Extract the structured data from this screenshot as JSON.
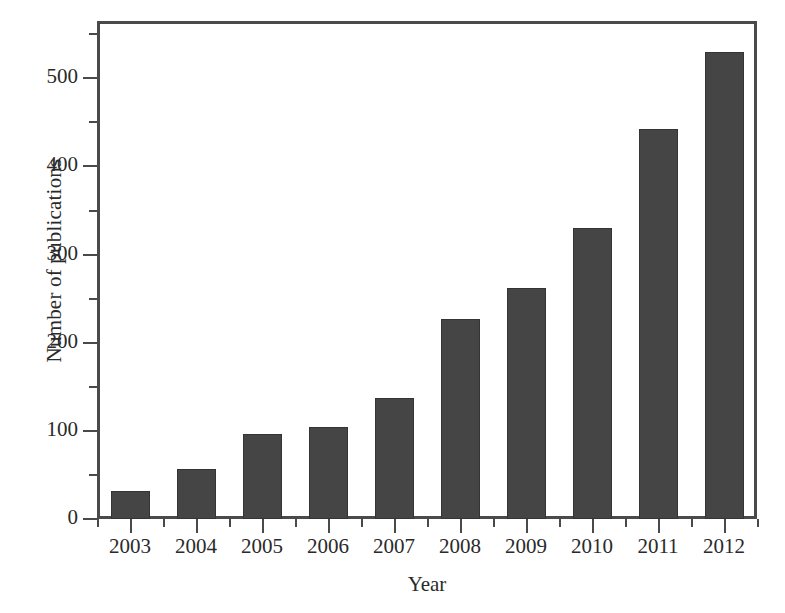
{
  "chart_data": {
    "type": "bar",
    "title": "",
    "xlabel": "Year",
    "ylabel": "Number of publications",
    "categories": [
      "2003",
      "2004",
      "2005",
      "2006",
      "2007",
      "2008",
      "2009",
      "2010",
      "2011",
      "2012"
    ],
    "values": [
      32,
      57,
      97,
      104,
      137,
      227,
      262,
      330,
      442,
      530
    ],
    "series": [
      {
        "name": "Number of publications",
        "values": [
          32,
          57,
          97,
          104,
          137,
          227,
          262,
          330,
          442,
          530
        ]
      }
    ],
    "ylim": [
      0,
      565
    ],
    "xlim_categories": [
      "2003",
      "2012"
    ],
    "y_major_ticks": [
      0,
      100,
      200,
      300,
      400,
      500
    ],
    "y_major_tick_labels": [
      "0",
      "100",
      "200",
      "300",
      "400",
      "500"
    ],
    "y_minor_ticks": [
      50,
      150,
      250,
      350,
      450,
      550
    ],
    "grid": false,
    "legend": null,
    "legend_position": "none",
    "bar_color": "#454545",
    "bar_edge_color": "#343434",
    "axis_color": "#4a4a4a",
    "background_color": "#ffffff"
  }
}
